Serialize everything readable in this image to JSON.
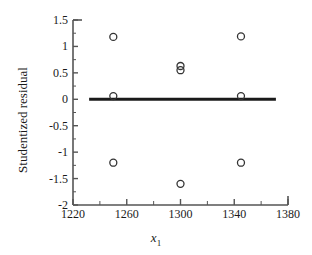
{
  "chart_data": {
    "type": "scatter",
    "title": "",
    "xlabel": "x_1",
    "xlabel_base": "x",
    "xlabel_sub": "1",
    "ylabel": "Studentized residual",
    "xlim": [
      1220,
      1380
    ],
    "ylim": [
      -2,
      1.5
    ],
    "xticks": [
      1220,
      1260,
      1300,
      1340,
      1380
    ],
    "xtick_labels": [
      "1220",
      "1260",
      "1300",
      "1340",
      "1380"
    ],
    "xminor_step": 20,
    "yticks": [
      1.5,
      1,
      0.5,
      0,
      -0.5,
      -1,
      -1.5,
      -2
    ],
    "ytick_labels": [
      "1.5",
      "1",
      "0.5",
      "0",
      "-0.5",
      "-1",
      "-1.5",
      "-2"
    ],
    "grid": false,
    "legend": null,
    "series": [
      {
        "name": "Studentized residuals",
        "marker": "open-circle",
        "marker_size": 7,
        "color": "#333333",
        "points": [
          {
            "x": 1250,
            "y": 1.18
          },
          {
            "x": 1345,
            "y": 1.19
          },
          {
            "x": 1300,
            "y": 0.63
          },
          {
            "x": 1300,
            "y": 0.55
          },
          {
            "x": 1250,
            "y": 0.06
          },
          {
            "x": 1345,
            "y": 0.06
          },
          {
            "x": 1250,
            "y": -1.2
          },
          {
            "x": 1345,
            "y": -1.2
          },
          {
            "x": 1300,
            "y": -1.6
          }
        ]
      }
    ],
    "reference_line": {
      "name": "zero-line",
      "y": 0,
      "x_start": 1232,
      "x_end": 1371,
      "color": "#1a1a1a",
      "width": 3
    },
    "axis_color": "#555555",
    "frame": {
      "left": true,
      "bottom": true,
      "top": false,
      "right": false
    }
  }
}
